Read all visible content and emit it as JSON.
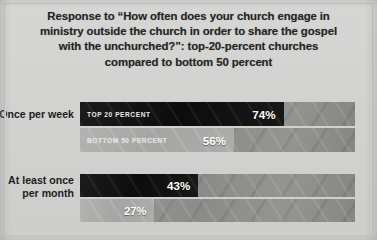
{
  "title": {
    "lines": [
      "Response to “How often does your church engage in",
      "ministry outside the church in order to share the gospel",
      "with the unchurched?”: top-20-percent churches",
      "compared to bottom 50 percent"
    ]
  },
  "colors": {
    "page_background": "#d3d3d1",
    "track": "#8e8e8c",
    "top20_bar": "#121212",
    "bottom50_bar": "#a9a9a7",
    "value_text": "#ffffff",
    "title_text": "#242424"
  },
  "chart_data": {
    "type": "bar",
    "orientation": "horizontal",
    "title": "Response to “How often does your church engage in ministry outside the church in order to share the gospel with the unchurched?”: top-20-percent churches compared to bottom 50 percent",
    "xlabel": "",
    "ylabel": "",
    "xlim": [
      0,
      100
    ],
    "grid": false,
    "legend": "inline-bar-labels",
    "value_suffix": "%",
    "categories": [
      "Once per week",
      "At least once per month"
    ],
    "series": [
      {
        "name": "TOP 20 PERCENT",
        "values": [
          74,
          56
        ]
      },
      {
        "name": "BOTTOM 50 PERCENT",
        "values": [
          43,
          27
        ]
      }
    ],
    "groups": [
      {
        "category": "Once per week",
        "bars": [
          {
            "series": "TOP 20 PERCENT",
            "value": 74,
            "value_label": "74%",
            "inline_label": "TOP 20 PERCENT",
            "style": "dark"
          },
          {
            "series": "TOP 20 PERCENT",
            "value": 56,
            "value_label": "56%",
            "inline_label": "BOTTOM 50 PERCENT",
            "style": "light"
          }
        ]
      },
      {
        "category": "At least once per month",
        "bars": [
          {
            "series": "BOTTOM 50 PERCENT",
            "value": 43,
            "value_label": "43%",
            "inline_label": "",
            "style": "dark"
          },
          {
            "series": "BOTTOM 50 PERCENT",
            "value": 27,
            "value_label": "27%",
            "inline_label": "",
            "style": "light"
          }
        ]
      }
    ]
  }
}
